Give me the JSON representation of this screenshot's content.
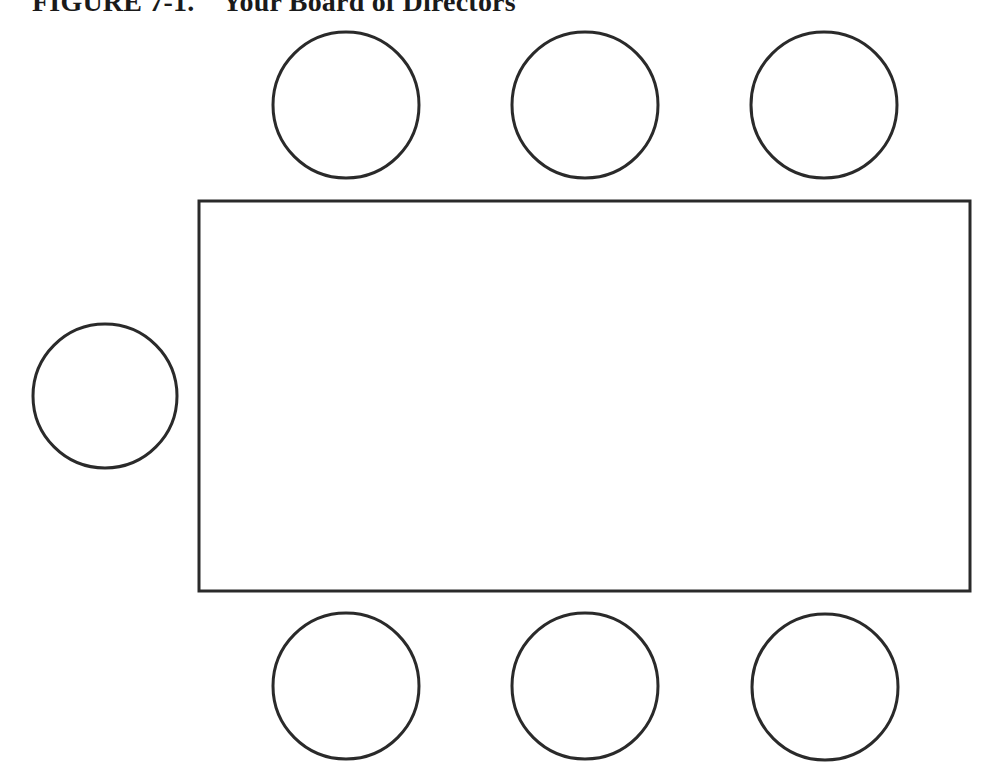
{
  "figure": {
    "title": "FIGURE 7-1.    Your Board of Directors",
    "stroke_color": "#2a2a2a",
    "table": {
      "x": 199,
      "y": 201,
      "width": 771,
      "height": 390,
      "label": ""
    },
    "seats": [
      {
        "id": "top-1",
        "cx": 346,
        "cy": 105,
        "r": 73
      },
      {
        "id": "top-2",
        "cx": 585,
        "cy": 105,
        "r": 73
      },
      {
        "id": "top-3",
        "cx": 824,
        "cy": 105,
        "r": 73
      },
      {
        "id": "left-1",
        "cx": 105,
        "cy": 396,
        "r": 72
      },
      {
        "id": "bottom-1",
        "cx": 346,
        "cy": 686,
        "r": 73
      },
      {
        "id": "bottom-2",
        "cx": 585,
        "cy": 686,
        "r": 73
      },
      {
        "id": "bottom-3",
        "cx": 825,
        "cy": 687,
        "r": 73
      }
    ]
  }
}
